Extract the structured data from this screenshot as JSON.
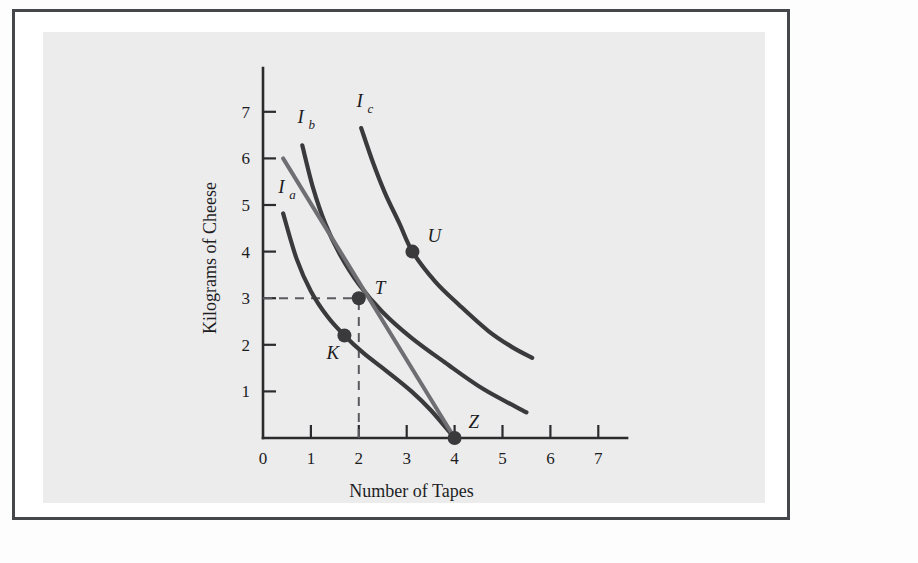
{
  "figure": {
    "background_color": "#ececed",
    "frame_color": "#45474a",
    "page_color": "#fdfdfd"
  },
  "chart_data": {
    "type": "line",
    "title": "",
    "xlabel": "Number of Tapes",
    "ylabel": "Kilograms of Cheese",
    "xlim": [
      0,
      7.6
    ],
    "ylim": [
      0,
      7.6
    ],
    "xticks": [
      0,
      1,
      2,
      3,
      4,
      5,
      6,
      7
    ],
    "yticks": [
      1,
      2,
      3,
      4,
      5,
      6,
      7
    ],
    "xticklabels": [
      "0",
      "1",
      "2",
      "3",
      "4",
      "5",
      "6",
      "7"
    ],
    "yticklabels": [
      "1",
      "2",
      "3",
      "4",
      "5",
      "6",
      "7"
    ],
    "origin_label": "0",
    "grid": false,
    "legend": "none",
    "curve_color": "#3a3a3d",
    "budget_color": "#6e6e73",
    "series": [
      {
        "name": "Ia",
        "label": "I",
        "label_sub": "a",
        "kind": "indifference-curve",
        "points": [
          [
            0.42,
            4.82
          ],
          [
            0.7,
            3.85
          ],
          [
            1.0,
            3.15
          ],
          [
            1.35,
            2.6
          ],
          [
            1.7,
            2.2
          ],
          [
            2.1,
            1.82
          ],
          [
            2.6,
            1.42
          ],
          [
            3.1,
            1.0
          ],
          [
            3.5,
            0.6
          ],
          [
            4.0,
            0.0
          ]
        ],
        "label_at": [
          0.32,
          5.25
        ]
      },
      {
        "name": "Ib",
        "label": "I",
        "label_sub": "b",
        "kind": "indifference-curve",
        "points": [
          [
            0.82,
            6.28
          ],
          [
            1.05,
            5.35
          ],
          [
            1.3,
            4.6
          ],
          [
            1.6,
            3.95
          ],
          [
            2.0,
            3.3
          ],
          [
            2.5,
            2.7
          ],
          [
            3.1,
            2.15
          ],
          [
            3.8,
            1.62
          ],
          [
            4.6,
            1.05
          ],
          [
            5.5,
            0.55
          ]
        ],
        "label_at": [
          0.72,
          6.75
        ]
      },
      {
        "name": "Ic",
        "label": "I",
        "label_sub": "c",
        "kind": "indifference-curve",
        "points": [
          [
            2.05,
            6.65
          ],
          [
            2.3,
            5.9
          ],
          [
            2.55,
            5.25
          ],
          [
            2.85,
            4.6
          ],
          [
            3.12,
            4.0
          ],
          [
            3.6,
            3.35
          ],
          [
            4.1,
            2.85
          ],
          [
            4.7,
            2.3
          ],
          [
            5.2,
            1.95
          ],
          [
            5.62,
            1.72
          ]
        ],
        "label_at": [
          1.95,
          7.1
        ]
      }
    ],
    "budget_line": {
      "name": "budget-line",
      "kind": "budget-constraint",
      "points": [
        [
          0.42,
          6.0
        ],
        [
          4.0,
          0.0
        ]
      ]
    },
    "points": [
      {
        "name": "K",
        "label": "K",
        "x": 1.7,
        "y": 2.2,
        "label_dx": -18,
        "label_dy": 24
      },
      {
        "name": "T",
        "label": "T",
        "x": 2.0,
        "y": 3.0,
        "label_dx": 16,
        "label_dy": -4
      },
      {
        "name": "U",
        "label": "U",
        "x": 3.12,
        "y": 4.0,
        "label_dx": 15,
        "label_dy": -10
      },
      {
        "name": "Z",
        "label": "Z",
        "x": 4.0,
        "y": 0.0,
        "label_dx": 14,
        "label_dy": -10
      }
    ],
    "guides": [
      {
        "name": "horizontal-guide-T",
        "from": [
          0,
          3.0
        ],
        "to": [
          2.0,
          3.0
        ]
      },
      {
        "name": "vertical-guide-T",
        "from": [
          2.0,
          0
        ],
        "to": [
          2.0,
          3.0
        ]
      }
    ],
    "annotations": [
      "Budget line runs from 6 kg of cheese to 4 tapes",
      "T is the tangency point of the budget line with indifference curve Ib",
      "K lies on Ia inside the budget line",
      "U lies on Ic beyond the budget line"
    ]
  }
}
